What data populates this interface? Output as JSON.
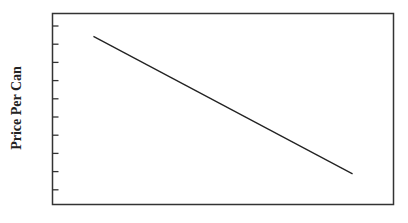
{
  "chart_data": {
    "type": "line",
    "title": "",
    "xlabel": "",
    "ylabel": "Price Per Can",
    "grid": false,
    "legend": null,
    "y_ticks": 10,
    "y_tick_labels": [],
    "x_tick_labels": [],
    "series": [
      {
        "name": "demand",
        "points": [
          [
            0.12,
            0.88
          ],
          [
            0.88,
            0.16
          ]
        ]
      }
    ],
    "xlim": [
      0,
      1
    ],
    "ylim": [
      0,
      1
    ]
  },
  "colors": {
    "axis": "#333333",
    "line": "#222222"
  }
}
